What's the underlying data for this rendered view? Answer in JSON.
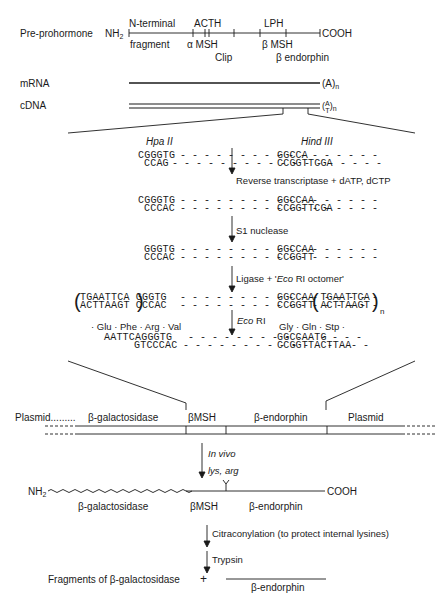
{
  "prohormone": {
    "label": "Pre-prohormone",
    "nterm": "NH2",
    "cterm": "COOH",
    "top_labels": [
      "N-terminal",
      "ACTH",
      "LPH"
    ],
    "bottom_labels": [
      "fragment",
      "α MSH",
      "β MSH"
    ],
    "lower_labels": [
      "Clip",
      "β endorphin"
    ]
  },
  "mrna": {
    "label": "mRNA",
    "tail": "(A)",
    "tail_sub": "n"
  },
  "cdna": {
    "label": "cDNA",
    "tail": "(A/T)",
    "tail_sub": "n"
  },
  "sites": {
    "left": "Hpa II",
    "right": "Hind III"
  },
  "steps": [
    {
      "top": [
        "CGGGTG",
        "GGCCA"
      ],
      "bottom": [
        "CCAG",
        "CCGGTTCGA"
      ],
      "arrow_label": "Reverse transcriptase + dATP, dCTP"
    },
    {
      "top": [
        "CGGGTG",
        "GGCCAA"
      ],
      "bottom": [
        "CCCAC",
        "CCGGTTCGA"
      ],
      "arrow_label": "S1 nuclease"
    },
    {
      "top": [
        "GGGTG",
        "GGCCAA"
      ],
      "bottom": [
        "CCCAC",
        "CCGGTT"
      ],
      "arrow_label": "Ligase + 'Eco RI octomer'"
    },
    {
      "top": [
        "(TGAATTCA)GGGTG",
        "GGCCAA(TGAATTCA)"
      ],
      "bottom": [
        "(ACTTAAGT)CCCAC",
        "CCGGTT(ACTTAAGT)"
      ],
      "sub": "n",
      "arrow_label": "Eco RI"
    },
    {
      "aa_left": "· Glu · Phe · Arg · Val",
      "aa_right": "Gly · Gln · Stp ·",
      "top": [
        "AATTCAGGGTG",
        "GGCCAATG"
      ],
      "bottom": [
        "GTCCCAC",
        "CCGGTTACTTAA"
      ]
    }
  ],
  "plasmid": {
    "left_label": "Plasmid.........",
    "segments": [
      "β-galactosidase",
      "βMSH",
      "β-endorphin",
      "Plasmid"
    ]
  },
  "in_vivo": {
    "label": "In vivo",
    "site": "lys, arg"
  },
  "fusion": {
    "nterm": "NH2",
    "cterm": "COOH",
    "labels": [
      "β-galactosidase",
      "βMSH",
      "β-endorphin"
    ]
  },
  "final_steps": [
    "Citraconylation (to protect internal lysines)",
    "Trypsin"
  ],
  "products": {
    "left": "Fragments of β-galactosidase",
    "plus": "+",
    "right": "β-endorphin"
  }
}
